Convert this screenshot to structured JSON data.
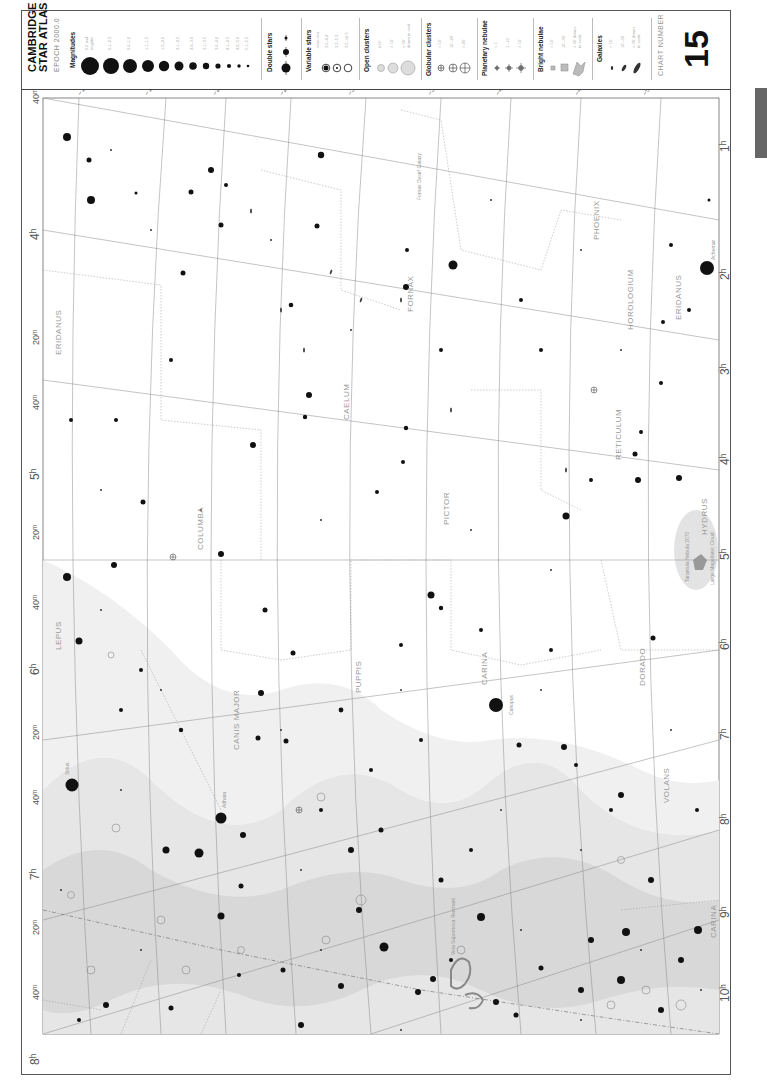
{
  "header": {
    "title_line1": "CAMBRIDGE",
    "title_line2": "STAR ATLAS",
    "epoch": "EPOCH 2000.0",
    "chart_number_label": "CHART NUMBER",
    "chart_number": "15"
  },
  "legend": {
    "magnitudes": {
      "heading": "Magnitudes",
      "items": [
        "0.0 and brighter",
        "0.1–0.5",
        "0.6–1.0",
        "1.1–1.5",
        "1.6–2.0",
        "2.1–2.5",
        "2.6–3.0",
        "3.1–3.5",
        "3.6–4.0",
        "4.1–4.5",
        "4.6–5.0",
        "5.1–5.5",
        "5.6–6.0",
        "6.1–6.5"
      ]
    },
    "double_stars": {
      "heading": "Double stars"
    },
    "variable_stars": {
      "heading": "Variable stars",
      "items": [
        "max–min",
        "3.0–4.2",
        "3.3–5.3",
        "3.5–<6.5"
      ]
    },
    "open_clusters": {
      "heading": "Open clusters",
      "items": [
        "≤10'",
        "> 10'",
        "> 30' drawn to scale"
      ]
    },
    "globular_clusters": {
      "heading": "Globular clusters",
      "items": [
        "< 10'",
        "10'–20'",
        "> 20'"
      ]
    },
    "planetary_nebulae": {
      "heading": "Planetary nebulae",
      "items": [
        "< 1'",
        "1'–10'",
        "> 10'"
      ]
    },
    "bright_nebulae": {
      "heading": "Bright nebulae",
      "items": [
        "< 10'",
        "10'–30'",
        "> 30' drawn to scale"
      ]
    },
    "galaxies": {
      "heading": "Galaxies",
      "items": [
        "< 10'",
        "10'–30'",
        "> 30' drawn to scale"
      ]
    }
  },
  "chart": {
    "ra_labels": [
      {
        "label": "4h",
        "pos": "top"
      },
      {
        "label": "20m",
        "pos": "top"
      },
      {
        "label": "40m",
        "pos": "top"
      },
      {
        "label": "5h",
        "pos": "top"
      },
      {
        "label": "20m",
        "pos": "top"
      },
      {
        "label": "40m",
        "pos": "top"
      },
      {
        "label": "6h",
        "pos": "top"
      },
      {
        "label": "20m",
        "pos": "top"
      },
      {
        "label": "40m",
        "pos": "top"
      },
      {
        "label": "7h",
        "pos": "top"
      },
      {
        "label": "20m",
        "pos": "top"
      },
      {
        "label": "40m",
        "pos": "top"
      },
      {
        "label": "8h",
        "pos": "top"
      },
      {
        "label": "20m",
        "pos": "top"
      }
    ],
    "ra_labels_right": [
      "1h",
      "2h",
      "3h",
      "4h",
      "5h",
      "6h",
      "7h",
      "8h",
      "9h",
      "10h",
      "11h"
    ],
    "dec_labels_top": [
      "-10°",
      "-15°",
      "-20°",
      "-25°",
      "-30°",
      "-35°",
      "-40°",
      "-45°",
      "-50°",
      "-55°"
    ],
    "dec_labels_bottom": [
      "-10°",
      "-15°",
      "-20°",
      "-25°",
      "-30°",
      "-35°",
      "-40°",
      "-45°",
      "-50°",
      "-55°"
    ],
    "corner_label_top": "40m",
    "corner_label_bottom": "20m",
    "constellations": [
      "ERIDANUS",
      "FORNAX",
      "PHOENIX",
      "HOROLOGIUM",
      "ERIDANUS",
      "HYDRUS",
      "CAELUM",
      "RETICULUM",
      "LEPUS",
      "COLUMBA",
      "PICTOR",
      "HYDRUS",
      "CANIS MAJOR",
      "PUPPIS",
      "CARINA",
      "DORADO",
      "MENSA",
      "VOLANS",
      "MON",
      "HYA",
      "HYA",
      "PYXIS",
      "ANTLIA",
      "VELA",
      "CARINA",
      "CEN"
    ],
    "named_objects": [
      "Sirius",
      "Adhara",
      "Canopus",
      "Achernar",
      "Fornax Dwarf Galaxy",
      "Large Magellanic Cloud",
      "Tarantula Nebula 2070",
      "Vela Supernova Remnant",
      "Galactic Equator"
    ],
    "catalog_labels": [
      "M41",
      "M47",
      "M46",
      "M93",
      "M79",
      "1851",
      "2070",
      "2516",
      "2808",
      "3114",
      "2477",
      "2451",
      "2547",
      "2546",
      "2439",
      "1261",
      "1313",
      "1365",
      "1300",
      "1316",
      "1399",
      "1404",
      "1097",
      "1532",
      "1792",
      "1808"
    ]
  },
  "colors": {
    "milky_way": "#e3e3e3",
    "milky_way_dense": "#d2d2d2",
    "grid": "#888888",
    "boundary": "#999999",
    "star": "#111111",
    "label": "#999999",
    "side_tab": "#666666"
  }
}
